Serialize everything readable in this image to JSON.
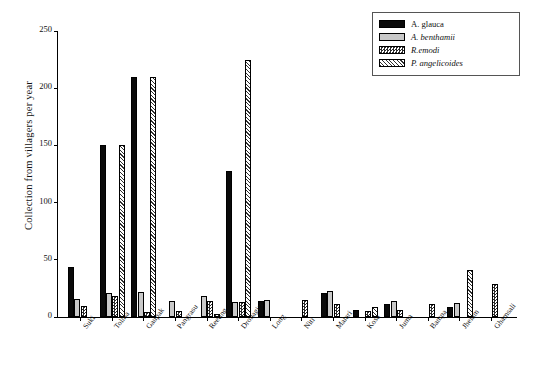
{
  "chart_data": {
    "type": "bar",
    "title": "",
    "xlabel": "",
    "ylabel": "Collection from villagers per year",
    "ylim": [
      0,
      250
    ],
    "yticks": [
      0,
      50,
      100,
      150,
      200,
      250
    ],
    "grid": false,
    "legend_position": "top-right",
    "categories": [
      "Suki",
      "Tolma",
      "Gaupak",
      "Pangrasu",
      "Reeting",
      "Dronagiri",
      "Long",
      "Niti",
      "Malari",
      "Kosa",
      "Juma",
      "Bampa",
      "Jhelam",
      "Ghamsali"
    ],
    "series": [
      {
        "name": "A. glauca",
        "fill": "solid-black",
        "color": "#0a0a0a",
        "values": [
          44,
          150,
          210,
          0,
          0,
          128,
          14,
          0,
          21,
          6,
          11,
          0,
          9,
          0
        ]
      },
      {
        "name": "A. benthamii",
        "fill": "solid-lightgray",
        "color": "#c9c9c9",
        "values": [
          16,
          21,
          22,
          14,
          18,
          13,
          15,
          0,
          23,
          0,
          14,
          0,
          12,
          0
        ]
      },
      {
        "name": "R.emodi",
        "fill": "checkered-dark",
        "color": "#2b2b2b",
        "values": [
          10,
          18,
          4,
          5,
          14,
          13,
          0,
          15,
          11,
          5,
          6,
          11,
          0,
          29
        ]
      },
      {
        "name": "P. angelicoides",
        "fill": "diagonal-hatch",
        "color": "#2f2f2f",
        "values": [
          0,
          150,
          210,
          0,
          3,
          225,
          0,
          0,
          0,
          9,
          0,
          0,
          41,
          0
        ]
      }
    ]
  },
  "legend": {
    "entries": [
      {
        "label": "A. glauca",
        "swatch": "solid-black",
        "italic": false
      },
      {
        "label": "A. benthamii",
        "swatch": "solid-lightgray",
        "italic": true
      },
      {
        "label": "R.emodi",
        "swatch": "checkered-dark",
        "italic": true
      },
      {
        "label": "P. angelicoides",
        "swatch": "diagonal-hatch",
        "italic": true
      }
    ]
  }
}
